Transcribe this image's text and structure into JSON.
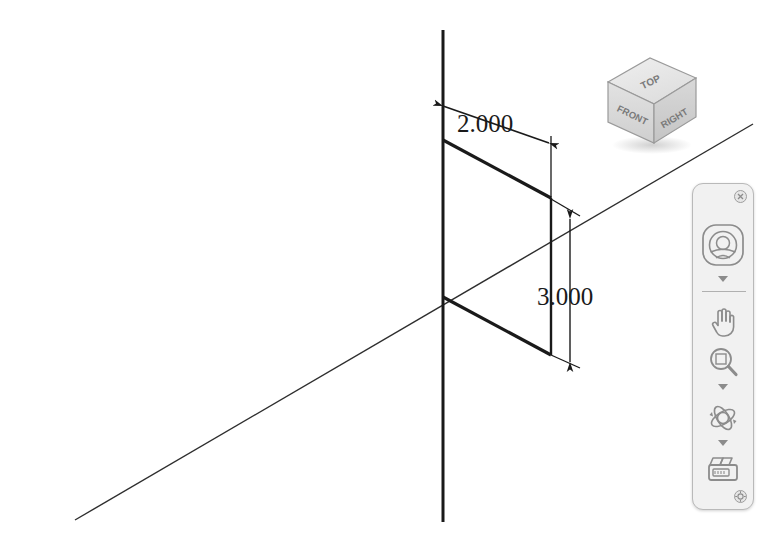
{
  "app": {
    "title": "3D Sketch Viewport",
    "background_color": "#ffffff"
  },
  "viewport": {
    "name": "graphics-area",
    "geometry": {
      "line_color": "#1a1a1a",
      "reference_line_color": "#3a3a3a",
      "origin": {
        "x": 443,
        "y": 297
      },
      "vertical_axis": {
        "x1": 443,
        "y1": 30,
        "x2": 443,
        "y2": 522
      },
      "diagonal_axis": {
        "x1": 75,
        "y1": 520,
        "x2": 753,
        "y2": 124
      },
      "rectangle_corners": [
        {
          "label": "top-left",
          "x": 443,
          "y": 140
        },
        {
          "label": "top-right",
          "x": 551,
          "y": 198
        },
        {
          "label": "bottom-right",
          "x": 551,
          "y": 355
        },
        {
          "label": "bottom-left",
          "x": 443,
          "y": 297
        }
      ]
    },
    "dimensions": [
      {
        "id": "width-dimension",
        "value": "2.000",
        "orientation": "edge-parallel",
        "text_x": 457,
        "text_y": 132,
        "line": {
          "x1": 443,
          "y1": 106,
          "x2": 549,
          "y2": 143
        },
        "ext1": {
          "x1": 443,
          "y1": 140,
          "x2": 443,
          "y2": 100
        },
        "ext2": {
          "x1": 551,
          "y1": 198,
          "x2": 551,
          "y2": 138
        }
      },
      {
        "id": "height-dimension",
        "value": "3.000",
        "orientation": "vertical",
        "text_x": 537,
        "text_y": 305,
        "line": {
          "x1": 570,
          "y1": 219,
          "x2": 570,
          "y2": 362
        },
        "ext1": {
          "x1": 551,
          "y1": 198,
          "x2": 578,
          "y2": 216
        },
        "ext2": {
          "x1": 551,
          "y1": 355,
          "x2": 578,
          "y2": 366
        }
      }
    ]
  },
  "viewcube": {
    "name": "view-cube",
    "faces": {
      "top": "TOP",
      "front": "FRONT",
      "right": "RIGHT"
    },
    "colors": {
      "top_fill": "#e8e8e8",
      "front_fill": "#dcdcdc",
      "right_fill": "#d2d2d2",
      "edge": "#9a9a9a",
      "label": "#7a7a7a"
    }
  },
  "view_toolbar": {
    "name": "heads-up-view-toolbar",
    "panel_color": "#f1f1f1",
    "border_color": "#b9b9b9",
    "icon_color": "#8c8c8c",
    "close_button": {
      "label": "",
      "icon": "close-icon",
      "tooltip": "Close"
    },
    "pin_button": {
      "label": "",
      "icon": "pin-icon",
      "tooltip": "Pin"
    },
    "items": [
      {
        "id": "navigation-wheel",
        "icon": "steering-wheel-icon",
        "label": "View Orientation",
        "has_dropdown": true
      },
      {
        "id": "pan",
        "icon": "hand-icon",
        "label": "Pan",
        "has_dropdown": false
      },
      {
        "id": "zoom",
        "icon": "magnifier-icon",
        "label": "Zoom to Area",
        "has_dropdown": true
      },
      {
        "id": "rotate",
        "icon": "orbit-icon",
        "label": "Rotate View",
        "has_dropdown": true
      },
      {
        "id": "display-style",
        "icon": "camera-icon",
        "label": "Display Style",
        "has_dropdown": false
      }
    ]
  }
}
